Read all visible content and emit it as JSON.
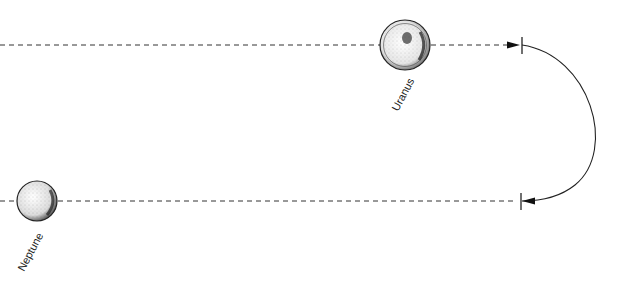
{
  "diagram": {
    "type": "orbital-path",
    "colors": {
      "line": "#333333",
      "planet_fill": "#f2f2f2",
      "planet_stroke": "#222222",
      "background": "#ffffff"
    },
    "planets": [
      {
        "name": "Uranus",
        "label": "Uranus",
        "cx": 405,
        "cy": 45,
        "r": 25
      },
      {
        "name": "Neptune",
        "label": "Neptune",
        "cx": 37,
        "cy": 201,
        "r": 20
      }
    ],
    "paths": [
      {
        "name": "top-trajectory",
        "style": "dashed",
        "y": 45,
        "x_start": 0,
        "x_end": 520,
        "arrow": "right"
      },
      {
        "name": "bottom-trajectory",
        "style": "dashed",
        "y": 201,
        "x_start": 0,
        "x_end": 520,
        "arrow": "left"
      },
      {
        "name": "turnaround-arc",
        "style": "solid",
        "from": [
          522,
          45
        ],
        "to": [
          522,
          201
        ],
        "bulge_x": 603
      }
    ]
  }
}
